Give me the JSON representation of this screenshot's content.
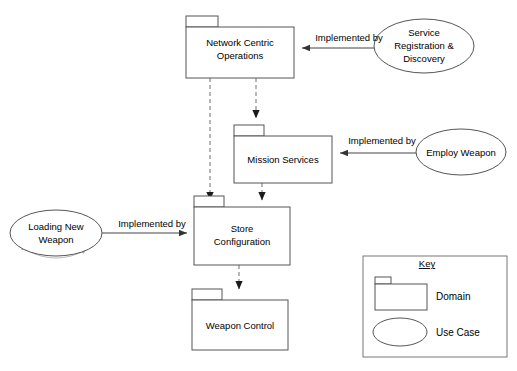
{
  "diagram": {
    "type": "uml-package-usecase-diagram",
    "background_color": "#ffffff",
    "stroke_color": "#555555",
    "dashed_edge_color": "#999999",
    "solid_edge_color": "#444444"
  },
  "packages": [
    {
      "id": "network-centric-operations",
      "label_line1": "Network Centric",
      "label_line2": "Operations",
      "x": 186,
      "y": 16,
      "w": 108,
      "h": 62
    },
    {
      "id": "mission-services",
      "label_line1": "Mission Services",
      "label_line2": "",
      "x": 234,
      "y": 125,
      "w": 98,
      "h": 58
    },
    {
      "id": "store-configuration",
      "label_line1": "Store",
      "label_line2": "Configuration",
      "x": 194,
      "y": 207,
      "w": 96,
      "h": 58
    },
    {
      "id": "weapon-control",
      "label_line1": "Weapon Control",
      "label_line2": "",
      "x": 192,
      "y": 296,
      "w": 96,
      "h": 54
    }
  ],
  "use_cases": [
    {
      "id": "service-registration-discovery",
      "label_line1": "Service",
      "label_line2": "Registration &",
      "label_line3": "Discovery",
      "cx": 424,
      "cy": 46,
      "rx": 50,
      "ry": 27
    },
    {
      "id": "employ-weapon",
      "label_line1": "Employ Weapon",
      "label_line2": "",
      "label_line3": "",
      "cx": 461,
      "cy": 152,
      "rx": 45,
      "ry": 23
    },
    {
      "id": "loading-new-weapon",
      "label_line1": "Loading New",
      "label_line2": "Weapon",
      "label_line3": "",
      "cx": 56,
      "cy": 233,
      "rx": 46,
      "ry": 23
    }
  ],
  "edges": [
    {
      "id": "edge-service-registration-to-nco",
      "label": "Implemented by",
      "label_x": 349,
      "label_y": 40,
      "from": "service-registration-discovery",
      "to": "network-centric-operations",
      "style": "solid"
    },
    {
      "id": "edge-employ-weapon-to-mission-services",
      "label": "Implemented by",
      "label_x": 382,
      "label_y": 142,
      "from": "employ-weapon",
      "to": "mission-services",
      "style": "solid"
    },
    {
      "id": "edge-loading-new-weapon-to-store-config",
      "label": "Implemented by",
      "label_x": 155,
      "label_y": 226,
      "from": "loading-new-weapon",
      "to": "store-configuration",
      "style": "solid"
    },
    {
      "id": "edge-nco-to-store-config",
      "label": "",
      "from": "network-centric-operations",
      "to": "store-configuration",
      "style": "dashed"
    },
    {
      "id": "edge-nco-to-mission-services",
      "label": "",
      "from": "network-centric-operations",
      "to": "mission-services",
      "style": "dashed"
    },
    {
      "id": "edge-mission-services-to-store-config",
      "label": "",
      "from": "mission-services",
      "to": "store-configuration",
      "style": "dashed"
    },
    {
      "id": "edge-store-config-to-weapon-control",
      "label": "",
      "from": "store-configuration",
      "to": "weapon-control",
      "style": "dashed"
    }
  ],
  "legend": {
    "title": "Key",
    "box": {
      "x": 363,
      "y": 256,
      "w": 144,
      "h": 101
    },
    "items": [
      {
        "id": "legend-domain",
        "label": "Domain",
        "shape": "package"
      },
      {
        "id": "legend-use-case",
        "label": "Use Case",
        "shape": "ellipse"
      }
    ]
  }
}
